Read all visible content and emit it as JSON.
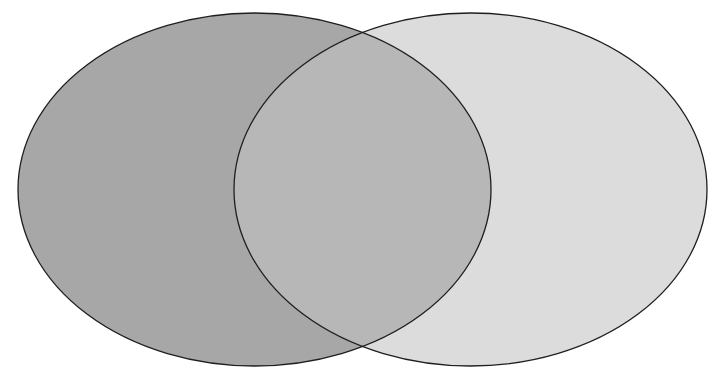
{
  "diagram": {
    "type": "venn",
    "set_count": 2,
    "labels": [],
    "sets": [
      {
        "id": "left",
        "cx": 254.5,
        "cy": 189.5,
        "rx": 236.5,
        "ry": 176.5,
        "fill": "#a7a7a7"
      },
      {
        "id": "right",
        "cx": 470.5,
        "cy": 189.5,
        "rx": 236.5,
        "ry": 176.5,
        "fill": "#dcdcdc"
      }
    ],
    "overlap_fill": "#b7b7b7",
    "stroke": "#1e1e1e",
    "stroke_width": 1.3,
    "background": "#ffffff"
  }
}
